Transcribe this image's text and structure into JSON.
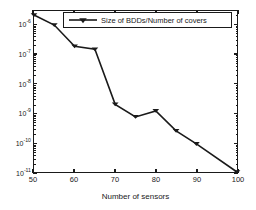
{
  "chart_data": {
    "type": "line",
    "title": "",
    "xlabel": "Number of sensors",
    "ylabel": "",
    "xlim": [
      50,
      100
    ],
    "ylim": [
      1e-11,
      3e-06
    ],
    "yscale": "log",
    "xscale": "linear",
    "grid": false,
    "legend_position": "top-center",
    "xticks": [
      "50",
      "60",
      "70",
      "80",
      "90",
      "100"
    ],
    "xtick_values": [
      50,
      60,
      70,
      80,
      90,
      100
    ],
    "ytick_labels": [
      "10",
      "10",
      "10",
      "10",
      "10",
      "10"
    ],
    "ytick_exponents": [
      "-6",
      "-7",
      "-8",
      "-9",
      "-10",
      "-11"
    ],
    "ytick_values": [
      1e-06,
      1e-07,
      1e-08,
      1e-09,
      1e-10,
      1e-11
    ],
    "series": [
      {
        "name": "Size of BDDs/Number of covers",
        "marker": "triangle-down",
        "color": "#1a1a1a",
        "x": [
          50,
          55,
          60,
          65,
          70,
          75,
          80,
          85,
          90,
          100
        ],
        "values": [
          2.2e-06,
          1e-06,
          1.9e-07,
          1.5e-07,
          2e-09,
          7.5e-10,
          1.2e-09,
          2.5e-10,
          9e-11,
          1e-11
        ]
      }
    ]
  },
  "legend": {
    "entry_label": "Size of BDDs/Number of covers"
  },
  "axes": {
    "x_title": "Number of sensors"
  }
}
